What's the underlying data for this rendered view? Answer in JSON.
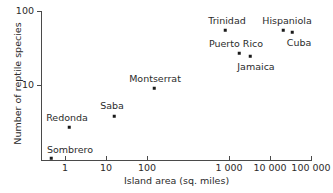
{
  "chart_data": {
    "type": "scatter",
    "title": "",
    "xlabel": "Island area (sq. miles)",
    "ylabel": "Number of reptile species",
    "xscale": "log",
    "yscale": "log",
    "xlim": [
      0.15,
      100000
    ],
    "ylim": [
      1,
      100
    ],
    "grid": false,
    "legend": "none",
    "xticks": [
      {
        "value": 1,
        "label": "1",
        "px": 65
      },
      {
        "value": 10,
        "label": "10",
        "px": 106
      },
      {
        "value": 100,
        "label": "100",
        "px": 147
      },
      {
        "value": 1000,
        "label": "1 000",
        "px": 229
      },
      {
        "value": 10000,
        "label": "10 000",
        "px": 270
      },
      {
        "value": 100000,
        "label": "100 000",
        "px": 311
      }
    ],
    "yticks": [
      {
        "value": 10,
        "label": "10",
        "py": 85
      },
      {
        "value": 100,
        "label": "100",
        "py": 11
      }
    ],
    "points": [
      {
        "name": "Sombrero",
        "area": 0.4,
        "species": 1.2,
        "px": 51,
        "py": 158,
        "label_px": 70,
        "label_py": 149
      },
      {
        "name": "Redonda",
        "area": 0.6,
        "species": 3.0,
        "px": 69,
        "py": 127,
        "label_px": 67,
        "label_py": 117
      },
      {
        "name": "Saba",
        "area": 5.0,
        "species": 5.0,
        "px": 114,
        "py": 116,
        "label_px": 112,
        "label_py": 105
      },
      {
        "name": "Montserrat",
        "area": 40,
        "species": 9.0,
        "px": 154,
        "py": 88,
        "label_px": 155,
        "label_py": 78
      },
      {
        "name": "Puerto Rico",
        "area": 3435,
        "species": 25,
        "px": 239,
        "py": 53,
        "label_px": 236,
        "label_py": 43
      },
      {
        "name": "Jamaica",
        "area": 4411,
        "species": 22,
        "px": 250,
        "py": 56,
        "label_px": 256,
        "label_py": 66
      },
      {
        "name": "Trinidad",
        "area": 1864,
        "species": 58,
        "px": 225,
        "py": 30,
        "label_px": 227,
        "label_py": 20
      },
      {
        "name": "Hispaniola",
        "area": 29418,
        "species": 58,
        "px": 283,
        "py": 30,
        "label_px": 287,
        "label_py": 20
      },
      {
        "name": "Cuba",
        "area": 44218,
        "species": 52,
        "px": 292,
        "py": 32,
        "label_px": 299,
        "label_py": 42
      }
    ]
  },
  "colors": {
    "axis": "#4a4a4a",
    "text": "#2b2b2b",
    "marker": "#1a1a1a",
    "background": "#ffffff"
  }
}
